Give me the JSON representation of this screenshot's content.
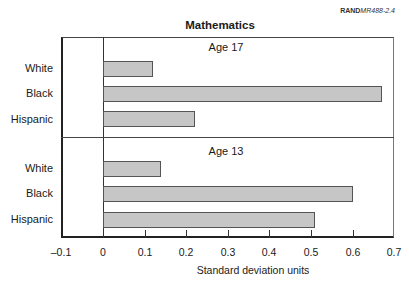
{
  "source_label": {
    "org": "RAND",
    "id": "MR488-2.4"
  },
  "chart_data": {
    "type": "bar",
    "orientation": "horizontal",
    "title": "Mathematics",
    "xlabel": "Standard deviation units",
    "ylabel": "",
    "xlim": [
      -0.1,
      0.7
    ],
    "xticks": [
      "-0.1",
      "0",
      "0.1",
      "0.2",
      "0.3",
      "0.4",
      "0.5",
      "0.6",
      "0.7"
    ],
    "grid": false,
    "legend": null,
    "panels": [
      {
        "label": "Age 17",
        "categories": [
          "White",
          "Black",
          "Hispanic"
        ],
        "values": [
          0.12,
          0.67,
          0.22
        ]
      },
      {
        "label": "Age 13",
        "categories": [
          "White",
          "Black",
          "Hispanic"
        ],
        "values": [
          0.14,
          0.6,
          0.51
        ]
      }
    ],
    "colors": {
      "bar_fill": "#c6c6c6",
      "bar_border": "#555555",
      "axis": "#222222"
    }
  }
}
